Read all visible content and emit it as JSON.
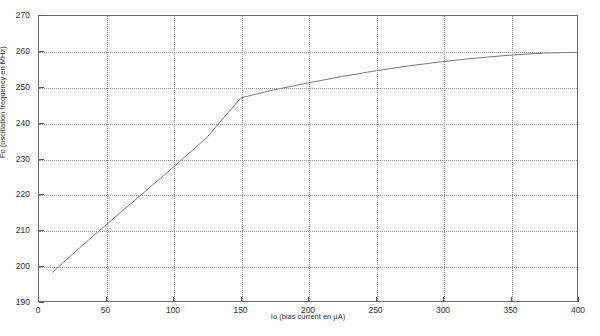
{
  "chart_data": {
    "type": "line",
    "title": "",
    "xlabel": "Io (bias current en µA)",
    "ylabel": "Fo (oscillation frequency en MHz)",
    "xlim": [
      0,
      400
    ],
    "ylim": [
      190,
      270
    ],
    "xticks": [
      0,
      50,
      100,
      150,
      200,
      250,
      300,
      350,
      400
    ],
    "xtick_labels": [
      "0",
      "50",
      "100",
      "150",
      "200",
      "250",
      "300",
      "350",
      "400"
    ],
    "yticks": [
      190,
      200,
      210,
      220,
      230,
      240,
      250,
      260,
      270
    ],
    "ytick_labels": [
      "190",
      "200",
      "210",
      "220",
      "230",
      "240",
      "250",
      "260",
      "270"
    ],
    "grid": true,
    "grid_style": "dotted",
    "legend": "none",
    "series": [
      {
        "name": "Fo vs Io",
        "color": "#777777",
        "x": [
          10,
          25,
          50,
          75,
          100,
          125,
          150,
          175,
          200,
          225,
          250,
          275,
          300,
          325,
          350,
          375,
          400
        ],
        "y": [
          198.0,
          203.2,
          211.4,
          219.5,
          227.6,
          236.0,
          247.0,
          249.3,
          251.2,
          253.0,
          254.6,
          256.0,
          257.2,
          258.2,
          259.0,
          259.6,
          259.8
        ]
      }
    ]
  },
  "figure": {
    "background_color": "#ffffff",
    "axis_color": "#6b6b6b",
    "grid_color": "#8e8e8e",
    "line_color": "#777777"
  }
}
